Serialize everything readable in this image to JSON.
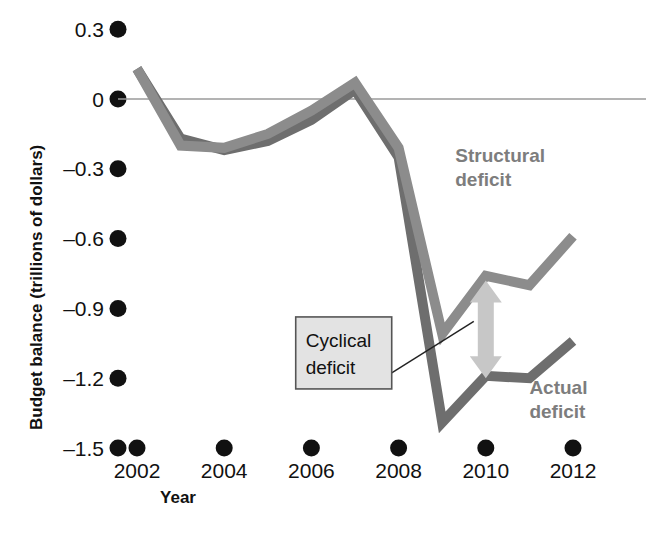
{
  "chart_data": {
    "type": "line",
    "title": "",
    "xlabel": "Year",
    "ylabel": "Budget balance (trillions of dollars)",
    "xlim": [
      2001.5,
      2012.6
    ],
    "ylim": [
      -1.5,
      0.3
    ],
    "xticks": [
      2002,
      2004,
      2006,
      2008,
      2010,
      2012
    ],
    "xtick_labels": [
      "2002",
      "2004",
      "2006",
      "2008",
      "2010",
      "2012"
    ],
    "yticks": [
      0.3,
      0,
      -0.3,
      -0.6,
      -0.9,
      -1.2,
      -1.5
    ],
    "ytick_labels": [
      "0.3",
      "0",
      "–0.3",
      "–0.6",
      "–0.9",
      "–1.2",
      "–1.5"
    ],
    "grid": false,
    "zero_line": true,
    "legend_position": "inline-annotation",
    "x": [
      2002,
      2003,
      2004,
      2005,
      2006,
      2007,
      2008,
      2009,
      2010,
      2011,
      2012
    ],
    "series": [
      {
        "name": "Structural deficit",
        "color": "#8c8c8c",
        "values": [
          0.13,
          -0.2,
          -0.21,
          -0.15,
          -0.05,
          0.07,
          -0.21,
          -1.01,
          -0.76,
          -0.8,
          -0.59
        ]
      },
      {
        "name": "Actual deficit",
        "color": "#6e6e6e",
        "values": [
          0.13,
          -0.17,
          -0.22,
          -0.18,
          -0.09,
          0.04,
          -0.25,
          -1.39,
          -1.19,
          -1.2,
          -1.04
        ]
      }
    ],
    "annotations": [
      {
        "name": "structural-deficit-label",
        "text_line1": "Structural",
        "text_line2": "deficit",
        "color": "#7d7d7d",
        "x": 2009.3,
        "y": -0.27
      },
      {
        "name": "actual-deficit-label",
        "text_line1": "Actual",
        "text_line2": "deficit",
        "color": "#7d7d7d",
        "x": 2011.0,
        "y": -1.27
      },
      {
        "name": "cyclical-deficit-callout",
        "text_line1": "Cyclical",
        "text_line2": "deficit",
        "box_fill": "#e3e3e3",
        "box_stroke": "#555555",
        "x": 2007.2,
        "y": -1.1
      }
    ],
    "arrow": {
      "name": "cyclical-gap-arrow",
      "color": "#c7c7c7",
      "x": 2010.0,
      "y_top": -0.78,
      "y_bottom": -1.2,
      "double_headed": true
    }
  },
  "axis": {
    "y_title": "Budget balance (trillions of dollars)",
    "x_title": "Year"
  }
}
